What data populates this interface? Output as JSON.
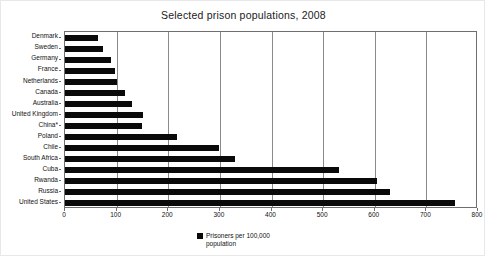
{
  "chart_data": {
    "type": "bar",
    "orientation": "horizontal",
    "title": "Selected prison populations, 2008",
    "xlabel": "",
    "ylabel": "",
    "xlim": [
      0,
      800
    ],
    "xticks": [
      0,
      100,
      200,
      300,
      400,
      500,
      600,
      700,
      800
    ],
    "grid": true,
    "legend_position": "bottom-center",
    "legend": [
      "Prisoners per 100,000 population"
    ],
    "series_name": "Prisoners per 100,000 population",
    "bar_color": "#0a0a0a",
    "categories": [
      "Denmark",
      "Sweden",
      "Germany",
      "France",
      "Netherlands",
      "Canada",
      "Australia",
      "United Kingdom",
      "China*",
      "Poland",
      "Chile",
      "South Africa",
      "Cuba",
      "Rwanda",
      "Russia",
      "United States"
    ],
    "values": [
      63,
      74,
      89,
      96,
      100,
      116,
      129,
      152,
      150,
      217,
      298,
      329,
      531,
      604,
      629,
      756
    ],
    "footnote_marker": "*"
  },
  "legend_entries": [
    {
      "label": "Prisoners per 100,000 population",
      "color": "#0a0a0a"
    }
  ],
  "axis": {
    "x_tick_labels": [
      "0",
      "100",
      "200",
      "300",
      "400",
      "500",
      "600",
      "700",
      "800"
    ]
  }
}
